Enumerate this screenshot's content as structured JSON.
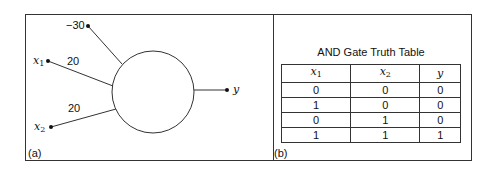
{
  "panel_a": {
    "label": "(a)",
    "bias_weight": "−30",
    "input1": {
      "name": "x",
      "sub": "1",
      "weight": "20"
    },
    "input2": {
      "name": "x",
      "sub": "2",
      "weight": "20"
    },
    "output": "y"
  },
  "panel_b": {
    "label": "(b)",
    "title": "AND Gate Truth Table",
    "columns": [
      {
        "name": "x",
        "sub": "1"
      },
      {
        "name": "x",
        "sub": "2"
      },
      {
        "name": "y",
        "sub": ""
      }
    ],
    "rows": [
      [
        "0",
        "0",
        "0"
      ],
      [
        "1",
        "0",
        "0"
      ],
      [
        "0",
        "1",
        "0"
      ],
      [
        "1",
        "1",
        "1"
      ]
    ]
  }
}
